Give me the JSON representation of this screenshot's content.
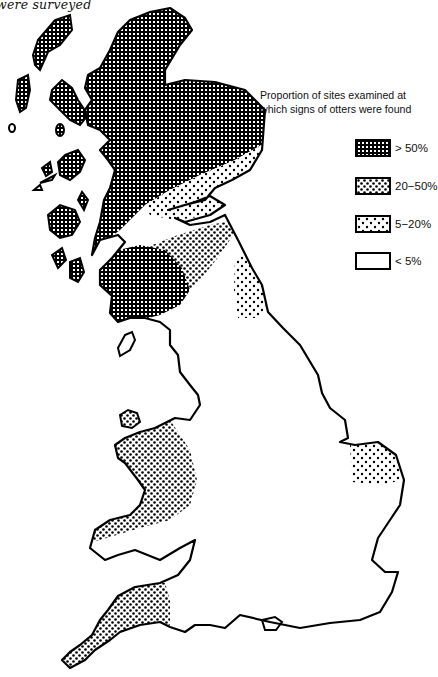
{
  "caption": "were surveyed",
  "legend": {
    "title_line1": "Proportion of sites examined at",
    "title_line2": "which signs of otters were found",
    "items": [
      {
        "label": "> 50%",
        "pattern": "crosshatch-dense",
        "color": "#000000"
      },
      {
        "label": "20−50%",
        "pattern": "dots-dense",
        "color": "#000000"
      },
      {
        "label": "5−20%",
        "pattern": "dots-sparse",
        "color": "#000000"
      },
      {
        "label": "< 5%",
        "pattern": "blank",
        "color": "#ffffff"
      }
    ]
  },
  "map": {
    "subject": "Great Britain",
    "regions": [
      {
        "name": "Northern and western Scotland / Highlands and islands",
        "category": "> 50%"
      },
      {
        "name": "Southwest Scotland (Galloway)",
        "category": "> 50%"
      },
      {
        "name": "Eastern Scotland band (Tayside/Fife)",
        "category": "5−20%"
      },
      {
        "name": "Southern Scotland (Borders)",
        "category": "20−50%"
      },
      {
        "name": "Northumberland",
        "category": "5−20%"
      },
      {
        "name": "Wales",
        "category": "20−50%"
      },
      {
        "name": "Southwest England (Devon and Cornwall)",
        "category": "20−50%"
      },
      {
        "name": "Norfolk (East Anglia)",
        "category": "5−20%"
      },
      {
        "name": "Rest of England",
        "category": "< 5%"
      }
    ]
  }
}
